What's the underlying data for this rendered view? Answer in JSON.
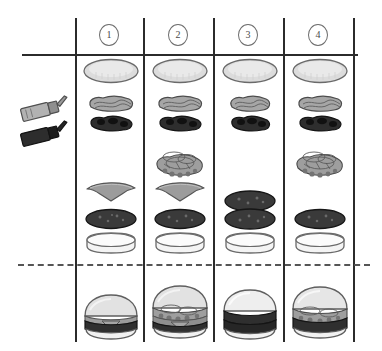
{
  "diagram": {
    "type": "assembly-matrix",
    "columns": [
      {
        "id": 1,
        "label": "1"
      },
      {
        "id": 2,
        "label": "2"
      },
      {
        "id": 3,
        "label": "3"
      },
      {
        "id": 4,
        "label": "4"
      }
    ],
    "tools": [
      {
        "name": "squeeze-bottle-light",
        "label": "Light sauce bottle",
        "color": "#9a9a9a"
      },
      {
        "name": "squeeze-bottle-dark",
        "label": "Dark sauce bottle",
        "color": "#2a2a2a"
      }
    ],
    "ingredients": {
      "top_bun": {
        "label": "Top bun",
        "color": "#dcdcdc",
        "stroke": "#6a6a6a"
      },
      "sauce_light": {
        "label": "Light sauce",
        "color": "#a6a6a6",
        "stroke": "#4c4c4c"
      },
      "sauce_dark": {
        "label": "Dark sauce",
        "color": "#2e2e2e",
        "stroke": "#141414"
      },
      "veggies": {
        "label": "Lettuce and onion",
        "color": "#9e9e9e",
        "stroke": "#4a4a4a"
      },
      "cheese": {
        "label": "Cheese slice",
        "color": "#9c9c9c",
        "stroke": "#555555"
      },
      "patty": {
        "label": "Beef patty",
        "color": "#3a3a3a",
        "stroke": "#161616"
      },
      "bottom_bun": {
        "label": "Bottom bun",
        "color": "#f2f2f2",
        "stroke": "#6a6a6a"
      }
    },
    "column_builds": [
      {
        "column": "1",
        "layers": [
          "top_bun",
          "sauce_light",
          "sauce_dark",
          "cheese",
          "patty",
          "bottom_bun"
        ],
        "patty_count": 1,
        "has_cheese": true,
        "has_veggies": false
      },
      {
        "column": "2",
        "layers": [
          "top_bun",
          "sauce_light",
          "sauce_dark",
          "veggies",
          "cheese",
          "patty",
          "bottom_bun"
        ],
        "patty_count": 1,
        "has_cheese": true,
        "has_veggies": true
      },
      {
        "column": "3",
        "layers": [
          "top_bun",
          "sauce_light",
          "sauce_dark",
          "patty",
          "patty",
          "bottom_bun"
        ],
        "patty_count": 2,
        "has_cheese": false,
        "has_veggies": false
      },
      {
        "column": "4",
        "layers": [
          "top_bun",
          "sauce_light",
          "sauce_dark",
          "veggies",
          "patty",
          "bottom_bun"
        ],
        "patty_count": 1,
        "has_cheese": false,
        "has_veggies": true
      }
    ],
    "assembled": [
      {
        "column": "1",
        "label": "Assembled burger 1",
        "patty_count": 1,
        "has_cheese": true,
        "has_veggies": false
      },
      {
        "column": "2",
        "label": "Assembled burger 2",
        "patty_count": 1,
        "has_cheese": true,
        "has_veggies": true
      },
      {
        "column": "3",
        "label": "Assembled burger 3",
        "patty_count": 2,
        "has_cheese": false,
        "has_veggies": false
      },
      {
        "column": "4",
        "label": "Assembled burger 4",
        "patty_count": 1,
        "has_cheese": false,
        "has_veggies": true
      }
    ],
    "separator": {
      "name": "dashed-divider",
      "style": "dashed"
    },
    "colors": {
      "ink": "#2b2b2b",
      "dashed": "#555555",
      "paper": "#ffffff"
    }
  }
}
